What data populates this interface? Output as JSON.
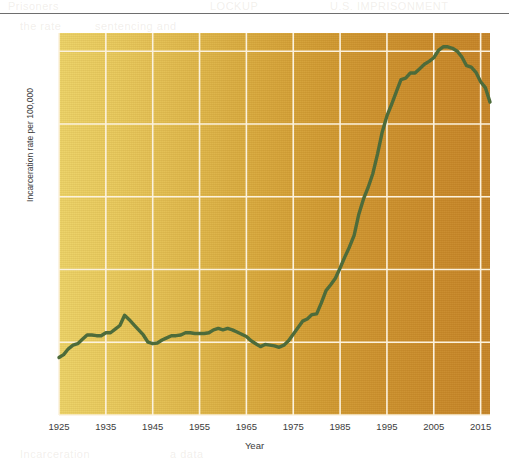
{
  "figure": {
    "background_color": "#ffffff",
    "line_color": "#4d6b3a",
    "grid_color": "#fbf2de",
    "plot_gradient_start": "#edd468",
    "plot_gradient_end": "#c68529",
    "faint_bleed_text": [
      "Prisoners",
      "LOCKUP",
      "DAT",
      "the rate",
      "U.S. IMPRISONMENT",
      "Incarceration",
      "sentencing and",
      "a data"
    ]
  },
  "chart_data": {
    "type": "line",
    "title": "",
    "subtitle": "",
    "xlabel": "Year",
    "ylabel": "Incarceration rate per 100,000",
    "xlim": [
      1925,
      2017
    ],
    "ylim": [
      0,
      525
    ],
    "grid": true,
    "legend": null,
    "yticks": [
      0,
      25,
      50,
      75,
      100,
      125,
      150,
      175,
      200,
      225,
      250,
      275,
      300,
      325,
      350,
      375,
      400,
      425,
      450,
      475,
      500,
      525
    ],
    "ytick_labels": [
      "0",
      "25",
      "50",
      "75",
      "100",
      "125",
      "150",
      "175",
      "200",
      "225",
      "250",
      "275",
      "300",
      "325",
      "350",
      "375",
      "400",
      "425",
      "450",
      "475",
      "500",
      "525"
    ],
    "xticks": [
      1925,
      1935,
      1945,
      1955,
      1965,
      1975,
      1985,
      1995,
      2005,
      2015
    ],
    "xtick_labels": [
      "1925",
      "1935",
      "1945",
      "1955",
      "1965",
      "1975",
      "1985",
      "1995",
      "2005",
      "2015"
    ],
    "series": [
      {
        "name": "Incarceration rate per 100,000",
        "color": "#4d6b3a",
        "x": [
          1925,
          1926,
          1927,
          1928,
          1929,
          1930,
          1931,
          1932,
          1933,
          1934,
          1935,
          1936,
          1937,
          1938,
          1939,
          1940,
          1941,
          1942,
          1943,
          1944,
          1945,
          1946,
          1947,
          1948,
          1949,
          1950,
          1951,
          1952,
          1953,
          1954,
          1955,
          1956,
          1957,
          1958,
          1959,
          1960,
          1961,
          1962,
          1963,
          1964,
          1965,
          1966,
          1967,
          1968,
          1969,
          1970,
          1971,
          1972,
          1973,
          1974,
          1975,
          1976,
          1977,
          1978,
          1979,
          1980,
          1981,
          1982,
          1983,
          1984,
          1985,
          1986,
          1987,
          1988,
          1989,
          1990,
          1991,
          1992,
          1993,
          1994,
          1995,
          1996,
          1997,
          1998,
          1999,
          2000,
          2001,
          2002,
          2003,
          2004,
          2005,
          2006,
          2007,
          2008,
          2009,
          2010,
          2011,
          2012,
          2013,
          2014,
          2015,
          2016,
          2017
        ],
        "y": [
          79,
          83,
          91,
          96,
          98,
          104,
          110,
          110,
          109,
          109,
          113,
          113,
          118,
          123,
          137,
          131,
          124,
          117,
          110,
          100,
          98,
          99,
          103,
          106,
          109,
          109,
          110,
          113,
          113,
          112,
          112,
          112,
          113,
          117,
          119,
          117,
          119,
          117,
          114,
          111,
          108,
          102,
          98,
          94,
          97,
          96,
          95,
          93,
          96,
          102,
          111,
          120,
          129,
          132,
          138,
          139,
          154,
          171,
          179,
          188,
          202,
          217,
          231,
          247,
          276,
          297,
          313,
          332,
          359,
          389,
          411,
          427,
          444,
          461,
          463,
          470,
          470,
          476,
          482,
          486,
          491,
          501,
          506,
          506,
          504,
          500,
          492,
          480,
          478,
          471,
          458,
          450,
          430
        ]
      }
    ]
  }
}
